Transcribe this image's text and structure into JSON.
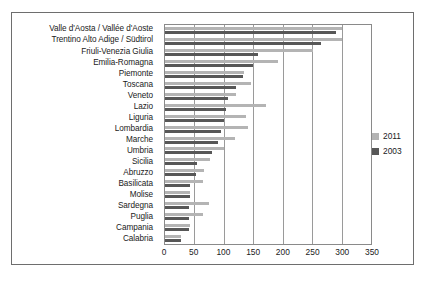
{
  "chart_data": {
    "type": "bar",
    "orientation": "horizontal",
    "title": "",
    "xlabel": "",
    "ylabel": "",
    "xlim": [
      0,
      350
    ],
    "xticks": [
      0,
      50,
      100,
      150,
      200,
      250,
      300,
      350
    ],
    "xtick_labels": [
      "0",
      "50",
      "100",
      "150",
      "200",
      "250",
      "300",
      "350"
    ],
    "grid": true,
    "legend_position": "right",
    "categories": [
      "Valle d'Aosta / Vallée d'Aoste",
      "Trentino Alto Adige / Südtirol",
      "Friuli-Venezia Giulia",
      "Emilia-Romagna",
      "Piemonte",
      "Toscana",
      "Veneto",
      "Lazio",
      "Liguria",
      "Lombardia",
      "Marche",
      "Umbria",
      "Sicilia",
      "Abruzzo",
      "Basilicata",
      "Molise",
      "Sardegna",
      "Puglia",
      "Campania",
      "Calabria"
    ],
    "series": [
      {
        "name": "2011",
        "color": "#b4b4b4",
        "values": [
          300,
          300,
          252,
          192,
          135,
          146,
          121,
          171,
          138,
          141,
          119,
          100,
          76,
          67,
          64,
          42,
          74,
          65,
          43,
          27
        ]
      },
      {
        "name": "2003",
        "color": "#575757",
        "values": [
          290,
          265,
          158,
          150,
          133,
          120,
          107,
          104,
          100,
          95,
          90,
          80,
          55,
          53,
          43,
          42,
          40,
          40,
          40,
          27
        ]
      }
    ]
  },
  "legend": {
    "entries": [
      {
        "label": "2011",
        "color": "#b4b4b4"
      },
      {
        "label": "2003",
        "color": "#575757"
      }
    ]
  }
}
